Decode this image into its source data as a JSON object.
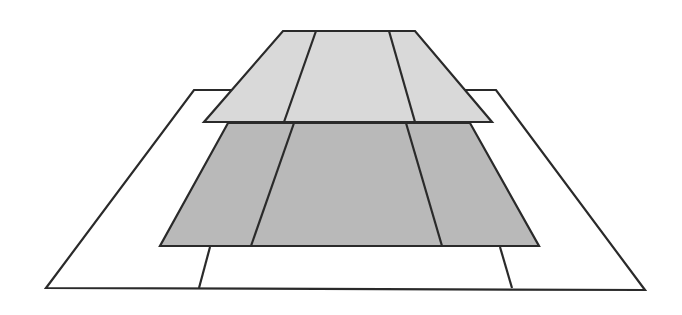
{
  "diagram": {
    "title": "",
    "colors": {
      "background": "#ffffff",
      "stroke": "#2a2a2a",
      "top_layer_fill": "#d9d9d9",
      "middle_layer_fill": "#b9b9b9",
      "base_layer_fill": "#ffffff"
    },
    "layers": [
      {
        "name": "base-plane",
        "outline": [
          [
            194,
            90
          ],
          [
            496,
            90
          ],
          [
            645,
            290
          ],
          [
            46,
            288
          ]
        ],
        "inner_lines": [
          [
            [
              210,
              247
            ],
            [
              199,
              288
            ]
          ],
          [
            [
              500,
              247
            ],
            [
              512,
              288
            ]
          ]
        ]
      },
      {
        "name": "middle-plane",
        "outline": [
          [
            228,
            123
          ],
          [
            470,
            123
          ],
          [
            539,
            246
          ],
          [
            160,
            246
          ]
        ],
        "dividers": [
          [
            [
              294,
              123
            ],
            [
              251,
              246
            ]
          ],
          [
            [
              406,
              123
            ],
            [
              442,
              246
            ]
          ]
        ]
      },
      {
        "name": "top-plane",
        "outline": [
          [
            283,
            31
          ],
          [
            415,
            31
          ],
          [
            492,
            122
          ],
          [
            204,
            122
          ]
        ],
        "dividers": [
          [
            [
              316,
              31
            ],
            [
              284,
              122
            ]
          ],
          [
            [
              389,
              31
            ],
            [
              415,
              122
            ]
          ]
        ]
      }
    ]
  }
}
